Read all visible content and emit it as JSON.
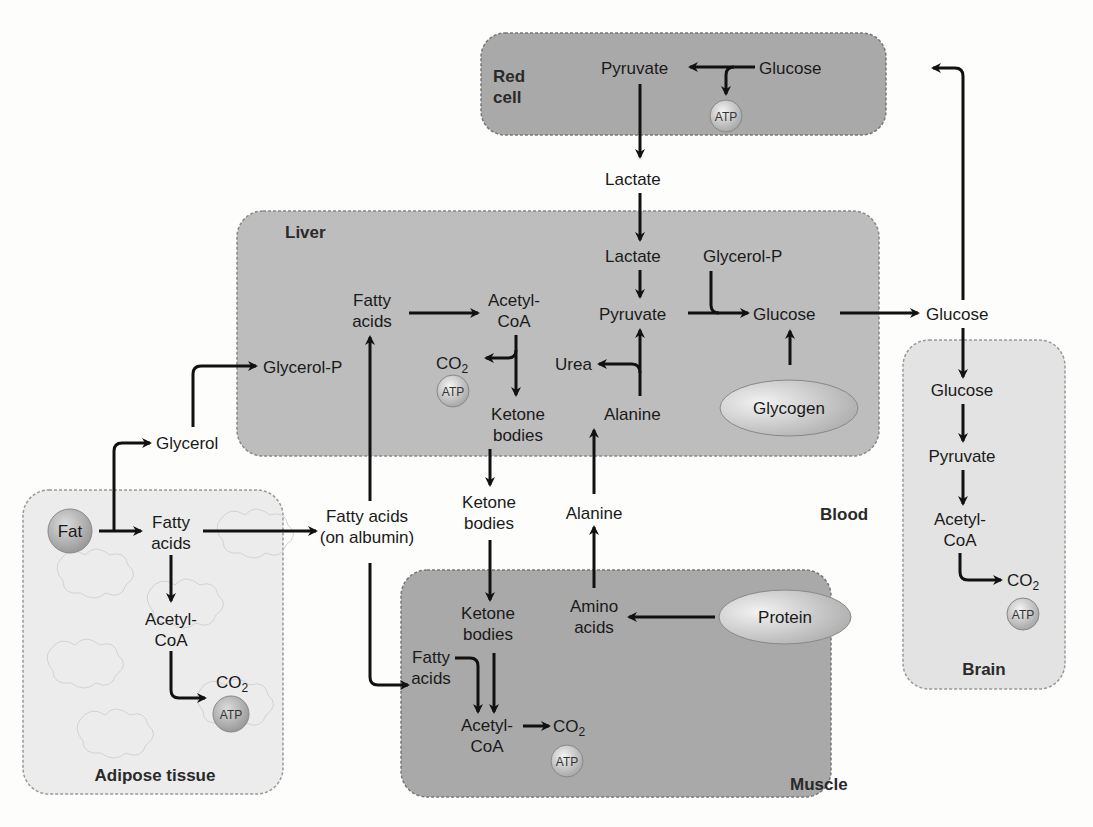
{
  "compartments": {
    "red_cell": {
      "label_line1": "Red",
      "label_line2": "cell",
      "pyruvate": "Pyruvate",
      "glucose": "Glucose",
      "atp": "ATP"
    },
    "liver": {
      "label": "Liver",
      "fatty_acids_1": "Fatty",
      "fatty_acids_2": "acids",
      "acetyl_1": "Acetyl-",
      "acetyl_2": "CoA",
      "co2": "CO",
      "co2_sub": "2",
      "atp": "ATP",
      "glycerol_p": "Glycerol-P",
      "ketone_1": "Ketone",
      "ketone_2": "bodies",
      "lactate": "Lactate",
      "pyruvate": "Pyruvate",
      "urea": "Urea",
      "alanine": "Alanine",
      "glycerol_p2": "Glycerol-P",
      "glucose": "Glucose",
      "glycogen": "Glycogen"
    },
    "blood": {
      "label": "Blood",
      "lactate": "Lactate",
      "glucose": "Glucose",
      "glycerol": "Glycerol",
      "fa_1": "Fatty acids",
      "fa_2": "(on albumin)",
      "ketone_1": "Ketone",
      "ketone_2": "bodies",
      "alanine": "Alanine"
    },
    "brain": {
      "label": "Brain",
      "glucose": "Glucose",
      "pyruvate": "Pyruvate",
      "acetyl_1": "Acetyl-",
      "acetyl_2": "CoA",
      "co2": "CO",
      "co2_sub": "2",
      "atp": "ATP"
    },
    "adipose": {
      "label": "Adipose tissue",
      "fat": "Fat",
      "fa_1": "Fatty",
      "fa_2": "acids",
      "acetyl_1": "Acetyl-",
      "acetyl_2": "CoA",
      "co2": "CO",
      "co2_sub": "2",
      "atp": "ATP"
    },
    "muscle": {
      "label": "Muscle",
      "ketone_1": "Ketone",
      "ketone_2": "bodies",
      "amino_1": "Amino",
      "amino_2": "acids",
      "protein": "Protein",
      "fa_1": "Fatty",
      "fa_2": "acids",
      "acetyl_1": "Acetyl-",
      "acetyl_2": "CoA",
      "co2": "CO",
      "co2_sub": "2",
      "atp": "ATP"
    }
  },
  "colors": {
    "dark_box": "#a9a9a9",
    "mid_box": "#bdbdbd",
    "light_box": "#e3e3e3",
    "arrow": "#111111"
  }
}
